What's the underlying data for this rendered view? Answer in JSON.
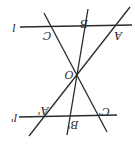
{
  "diagram": {
    "orientation": "rotated 180 degrees",
    "stroke_color": "#2a2a2a",
    "background": "#ffffff",
    "center_label": "O",
    "top_line": {
      "label": "l",
      "points": [
        "C",
        "B",
        "A"
      ]
    },
    "bottom_line": {
      "label": "l'",
      "points": [
        "A'",
        "B'",
        "C'"
      ]
    }
  }
}
